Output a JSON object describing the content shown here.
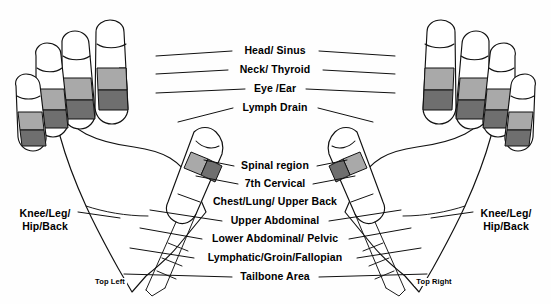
{
  "chart": {
    "background_color": "#fefefe",
    "line_color": "#111111",
    "band_light_color": "#a9a9a9",
    "band_dark_color": "#6f6f6f"
  },
  "center_labels": [
    {
      "text": "Head/ Sinus",
      "x": 275,
      "y": 51
    },
    {
      "text": "Neck/ Thyroid",
      "x": 275,
      "y": 70
    },
    {
      "text": "Eye /Ear",
      "x": 275,
      "y": 89
    },
    {
      "text": "Lymph Drain",
      "x": 275,
      "y": 108
    },
    {
      "text": "Spinal region",
      "x": 275,
      "y": 166
    },
    {
      "text": "7th Cervical",
      "x": 275,
      "y": 184
    },
    {
      "text": "Chest/Lung/ Upper Back",
      "x": 275,
      "y": 202
    },
    {
      "text": "Upper Abdominal",
      "x": 275,
      "y": 221
    },
    {
      "text": "Lower Abdominal/ Pelvic",
      "x": 275,
      "y": 239
    },
    {
      "text": "Lymphatic/Groin/Fallopian",
      "x": 275,
      "y": 258
    },
    {
      "text": "Tailbone Area",
      "x": 275,
      "y": 277
    }
  ],
  "side_labels": [
    {
      "id": "left-knee",
      "line1": "Knee/Leg/",
      "line2": "Hip/Back",
      "x": 45,
      "y": 216
    },
    {
      "id": "right-knee",
      "line1": "Knee/Leg/",
      "line2": "Hip/Back",
      "x": 506,
      "y": 216
    }
  ],
  "foot_labels": [
    {
      "id": "top-left",
      "text": "Top Left",
      "x": 110,
      "y": 283
    },
    {
      "id": "top-right",
      "text": "Top Right",
      "x": 434,
      "y": 283
    }
  ],
  "hands": [
    {
      "id": "left-hand",
      "side": "left",
      "finger_count": 4,
      "thumb": true
    },
    {
      "id": "right-hand",
      "side": "right",
      "finger_count": 4,
      "thumb": true
    }
  ]
}
